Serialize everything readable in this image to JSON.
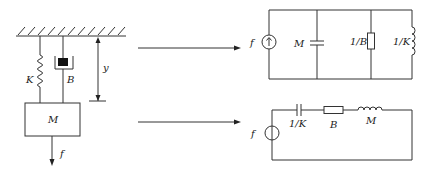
{
  "mechanical": {
    "spring_label": "K",
    "damper_label": "B",
    "displacement_label": "y",
    "mass_label": "M",
    "force_label": "f"
  },
  "parallel_circuit": {
    "source_label": "f",
    "source_type": "current-source",
    "capacitor_label": "M",
    "resistor_label": "1/B",
    "inductor_label": "1/K"
  },
  "series_circuit": {
    "source_label": "f",
    "source_type": "voltage-source",
    "capacitor_label": "1/K",
    "resistor_label": "B",
    "inductor_label": "M"
  },
  "colors": {
    "line": "#333333",
    "background": "#ffffff"
  }
}
